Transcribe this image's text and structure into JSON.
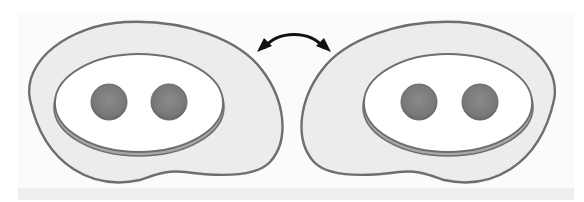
{
  "figure": {
    "colors": {
      "background": "#ffffff",
      "outer_fill": "#ececec",
      "outline": "#6e6e6e",
      "inner_fill": "#ffffff",
      "rim": "#a8a8a8",
      "sphere": "#7a7a7a",
      "arrow": "#111111"
    },
    "elements": [
      {
        "id": "left-cell",
        "spheres": 2
      },
      {
        "id": "interconversion-arrow",
        "type": "double-headed curved arrow"
      },
      {
        "id": "right-cell",
        "spheres": 2,
        "mirror_of": "left-cell"
      }
    ]
  }
}
